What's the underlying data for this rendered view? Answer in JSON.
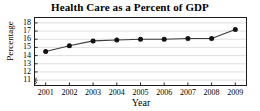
{
  "chart_data": {
    "type": "line",
    "title": "Health Care as a Percent of GDP",
    "xlabel": "Year",
    "ylabel": "Percentage",
    "categories": [
      "2001",
      "2002",
      "2003",
      "2004",
      "2005",
      "2006",
      "2007",
      "2008",
      "2009"
    ],
    "x": [
      2001,
      2002,
      2003,
      2004,
      2005,
      2006,
      2007,
      2008,
      2009
    ],
    "values": [
      14.5,
      15.2,
      15.8,
      15.9,
      16.0,
      16.0,
      16.1,
      16.1,
      17.2
    ],
    "series": [
      {
        "name": "Health Care Percent of GDP",
        "values": [
          14.5,
          15.2,
          15.8,
          15.9,
          16.0,
          16.0,
          16.1,
          16.1,
          17.2
        ]
      }
    ],
    "ylim": [
      10.4,
      18.6
    ],
    "xlim": [
      2000.55,
      2009.45
    ],
    "yticks": [
      11,
      12,
      13,
      14,
      15,
      16,
      17,
      18
    ],
    "ytick_labels": [
      "11",
      "12",
      "13",
      "14",
      "15",
      "16",
      "17",
      "18"
    ],
    "xticks": [
      2001,
      2002,
      2003,
      2004,
      2005,
      2006,
      2007,
      2008,
      2009
    ],
    "xtick_labels": [
      "2001",
      "2002",
      "2003",
      "2004",
      "2005",
      "2006",
      "2007",
      "2008",
      "2009"
    ],
    "grid": "horizontal",
    "legend": "none",
    "axis_break": true,
    "colors": {
      "line": "#3b3b3b",
      "marker": "#111111",
      "gridline": "#d8d8d8",
      "frame": "#1a1a1a",
      "background": "#ffffff",
      "text": "#000000"
    },
    "marker_style": "filled-circle",
    "line_width": 1.1,
    "marker_size": 2.5
  }
}
